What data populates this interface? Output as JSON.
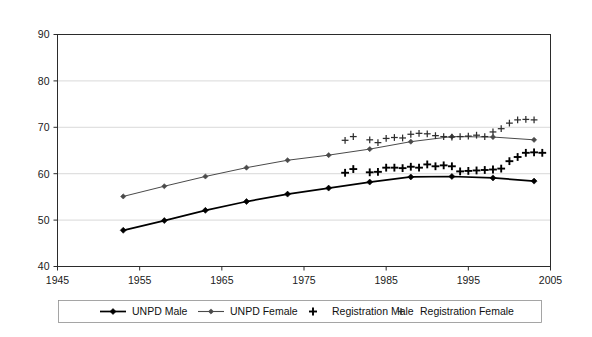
{
  "chart_data": {
    "type": "line",
    "title": "",
    "subtitle": "",
    "xlabel": "",
    "ylabel": "",
    "xlim": [
      1945,
      2005
    ],
    "ylim": [
      40,
      90
    ],
    "xticks": [
      1945,
      1955,
      1965,
      1975,
      1985,
      1995,
      2005
    ],
    "yticks": [
      40,
      50,
      60,
      70,
      80,
      90
    ],
    "xtick_labels": [
      "1945",
      "1955",
      "1965",
      "1975",
      "1985",
      "1995",
      "2005"
    ],
    "ytick_labels": [
      "40",
      "50",
      "60",
      "70",
      "80",
      "90"
    ],
    "grid": "horizontal",
    "legend_position": "bottom",
    "legend": [
      {
        "name": "UNPD Male",
        "marker": "diamond-line",
        "color": "#000000"
      },
      {
        "name": "UNPD Female",
        "marker": "diamond-line",
        "color": "#4a4a4a"
      },
      {
        "name": "Registration Male",
        "marker": "plus",
        "color": "#000000"
      },
      {
        "name": "Registration Female",
        "marker": "plus",
        "color": "#2e2e2e"
      }
    ],
    "series": [
      {
        "name": "UNPD Male",
        "type": "line",
        "marker": "diamond",
        "color": "#000000",
        "points": [
          {
            "x": 1953,
            "y": 47.8
          },
          {
            "x": 1958,
            "y": 49.9
          },
          {
            "x": 1963,
            "y": 52.1
          },
          {
            "x": 1968,
            "y": 54.0
          },
          {
            "x": 1973,
            "y": 55.6
          },
          {
            "x": 1978,
            "y": 56.9
          },
          {
            "x": 1983,
            "y": 58.2
          },
          {
            "x": 1988,
            "y": 59.3
          },
          {
            "x": 1993,
            "y": 59.4
          },
          {
            "x": 1998,
            "y": 59.1
          },
          {
            "x": 2003,
            "y": 58.4
          }
        ]
      },
      {
        "name": "UNPD Female",
        "type": "line",
        "marker": "diamond",
        "color": "#4a4a4a",
        "points": [
          {
            "x": 1953,
            "y": 55.1
          },
          {
            "x": 1958,
            "y": 57.3
          },
          {
            "x": 1963,
            "y": 59.4
          },
          {
            "x": 1968,
            "y": 61.3
          },
          {
            "x": 1973,
            "y": 62.9
          },
          {
            "x": 1978,
            "y": 64.0
          },
          {
            "x": 1983,
            "y": 65.3
          },
          {
            "x": 1988,
            "y": 66.9
          },
          {
            "x": 1993,
            "y": 68.0
          },
          {
            "x": 1998,
            "y": 67.9
          },
          {
            "x": 2003,
            "y": 67.3
          }
        ]
      },
      {
        "name": "Registration Male",
        "type": "scatter",
        "marker": "plus",
        "color": "#000000",
        "points": [
          {
            "x": 1980,
            "y": 60.2
          },
          {
            "x": 1981,
            "y": 61.0
          },
          {
            "x": 1983,
            "y": 60.3
          },
          {
            "x": 1984,
            "y": 60.4
          },
          {
            "x": 1985,
            "y": 61.3
          },
          {
            "x": 1986,
            "y": 61.3
          },
          {
            "x": 1987,
            "y": 61.2
          },
          {
            "x": 1988,
            "y": 61.5
          },
          {
            "x": 1989,
            "y": 61.3
          },
          {
            "x": 1990,
            "y": 62.0
          },
          {
            "x": 1991,
            "y": 61.6
          },
          {
            "x": 1992,
            "y": 61.8
          },
          {
            "x": 1993,
            "y": 61.6
          },
          {
            "x": 1994,
            "y": 60.5
          },
          {
            "x": 1995,
            "y": 60.6
          },
          {
            "x": 1996,
            "y": 60.7
          },
          {
            "x": 1997,
            "y": 60.8
          },
          {
            "x": 1998,
            "y": 60.9
          },
          {
            "x": 1999,
            "y": 61.1
          },
          {
            "x": 2000,
            "y": 62.7
          },
          {
            "x": 2001,
            "y": 63.6
          },
          {
            "x": 2002,
            "y": 64.5
          },
          {
            "x": 2003,
            "y": 64.6
          },
          {
            "x": 2004,
            "y": 64.5
          }
        ]
      },
      {
        "name": "Registration Female",
        "type": "scatter",
        "marker": "plus",
        "color": "#2e2e2e",
        "points": [
          {
            "x": 1980,
            "y": 67.2
          },
          {
            "x": 1981,
            "y": 68.0
          },
          {
            "x": 1983,
            "y": 67.3
          },
          {
            "x": 1984,
            "y": 66.7
          },
          {
            "x": 1985,
            "y": 67.6
          },
          {
            "x": 1986,
            "y": 67.8
          },
          {
            "x": 1987,
            "y": 67.7
          },
          {
            "x": 1988,
            "y": 68.5
          },
          {
            "x": 1989,
            "y": 68.7
          },
          {
            "x": 1990,
            "y": 68.6
          },
          {
            "x": 1991,
            "y": 68.2
          },
          {
            "x": 1992,
            "y": 68.0
          },
          {
            "x": 1993,
            "y": 67.9
          },
          {
            "x": 1994,
            "y": 68.0
          },
          {
            "x": 1995,
            "y": 68.1
          },
          {
            "x": 1996,
            "y": 68.3
          },
          {
            "x": 1997,
            "y": 68.0
          },
          {
            "x": 1998,
            "y": 69.0
          },
          {
            "x": 1999,
            "y": 69.7
          },
          {
            "x": 2000,
            "y": 70.9
          },
          {
            "x": 2001,
            "y": 71.6
          },
          {
            "x": 2002,
            "y": 71.7
          },
          {
            "x": 2003,
            "y": 71.6
          }
        ]
      }
    ]
  }
}
